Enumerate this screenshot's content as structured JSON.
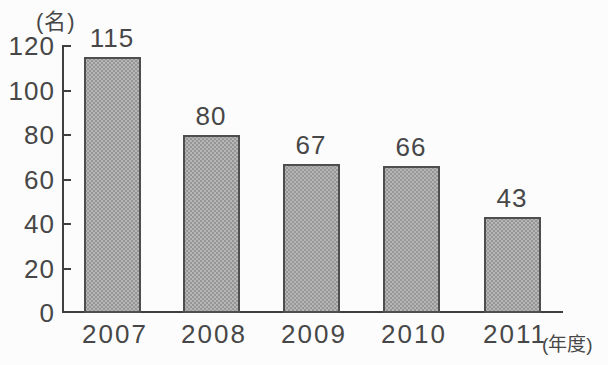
{
  "chart_data": {
    "type": "bar",
    "title": "",
    "categories": [
      "2007",
      "2008",
      "2009",
      "2010",
      "2011"
    ],
    "values": [
      115,
      80,
      67,
      66,
      43
    ],
    "xlabel": "(年度)",
    "ylabel": "(名)",
    "ylim": [
      0,
      120
    ],
    "yticks": [
      0,
      20,
      40,
      60,
      80,
      100,
      120
    ],
    "grid": "off",
    "legend": "none",
    "bar_fill_color": "#b6b6b6",
    "bar_dot_color": "#969696",
    "bar_border_color": "#4e4e4e",
    "axis_color": "#3f3f3f",
    "text_color": "#474747",
    "background_color": "#fcfcfc"
  }
}
